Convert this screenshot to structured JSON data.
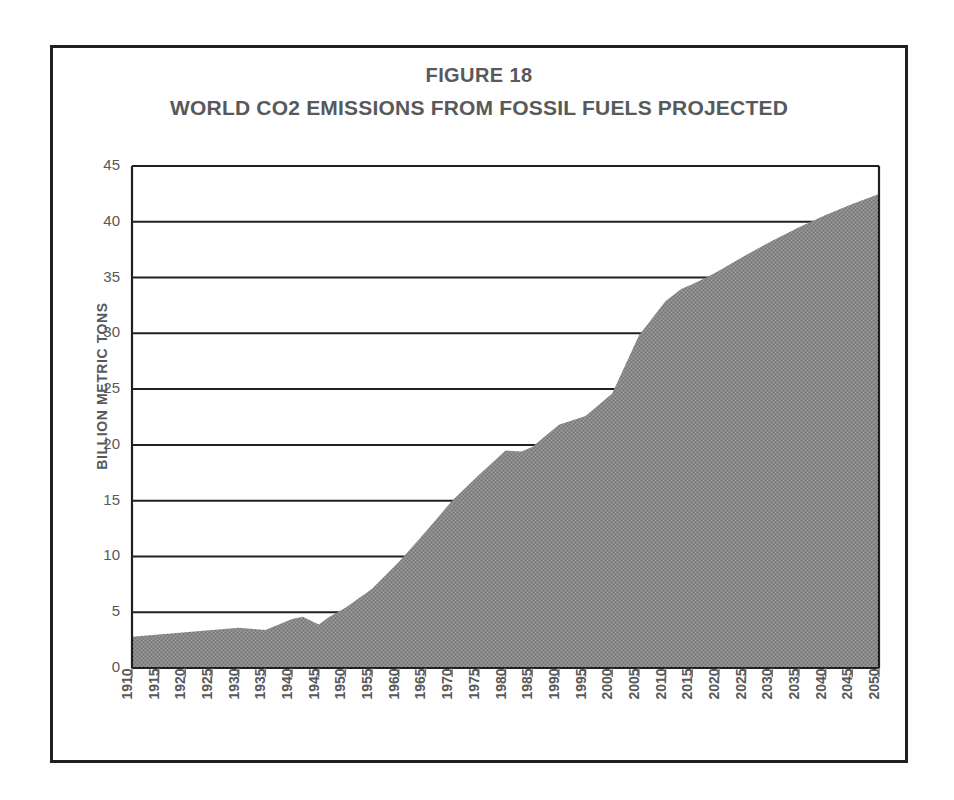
{
  "figure": {
    "label": "FIGURE 18",
    "title": "WORLD CO2 EMISSIONS FROM FOSSIL FUELS PROJECTED",
    "frame_color": "#231f20",
    "text_color": "#58595b",
    "background": "#ffffff"
  },
  "chart_data": {
    "type": "area",
    "title": "WORLD CO2 EMISSIONS FROM FOSSIL FUELS PROJECTED",
    "subtitle": "FIGURE 18",
    "xlabel": "",
    "ylabel": "BILLION METRIC TONS",
    "ylim": [
      0,
      45
    ],
    "xlim": [
      1910,
      2050
    ],
    "ytick_step": 5,
    "xtick_step": 5,
    "grid": true,
    "legend": false,
    "series_color": "#808080",
    "ytick_labels": [
      "0",
      "5",
      "10",
      "15",
      "20",
      "25",
      "30",
      "35",
      "40",
      "45"
    ],
    "yticks": [
      0,
      5,
      10,
      15,
      20,
      25,
      30,
      35,
      40,
      45
    ],
    "xtick_labels": [
      "1910",
      "1915",
      "1920",
      "1925",
      "1930",
      "1935",
      "1940",
      "1945",
      "1950",
      "1955",
      "1960",
      "1965",
      "1970",
      "1975",
      "1980",
      "1985",
      "1990",
      "1995",
      "2000",
      "2005",
      "2010",
      "2015",
      "2020",
      "2025",
      "2030",
      "2035",
      "2040",
      "2045",
      "2050"
    ],
    "x": [
      1910,
      1915,
      1920,
      1925,
      1930,
      1935,
      1940,
      1942,
      1945,
      1947,
      1950,
      1955,
      1960,
      1965,
      1970,
      1975,
      1980,
      1983,
      1985,
      1990,
      1995,
      2000,
      2005,
      2010,
      2013,
      2015,
      2018,
      2020,
      2025,
      2030,
      2035,
      2040,
      2045,
      2050
    ],
    "values": [
      2.8,
      3.0,
      3.2,
      3.4,
      3.6,
      3.4,
      4.4,
      4.6,
      3.9,
      4.6,
      5.4,
      7.1,
      9.5,
      12.2,
      15.0,
      17.3,
      19.5,
      19.4,
      19.8,
      21.8,
      22.6,
      24.6,
      29.8,
      32.9,
      34.0,
      34.4,
      35.1,
      35.6,
      37.0,
      38.3,
      39.5,
      40.6,
      41.6,
      42.5
    ],
    "annotations": []
  }
}
